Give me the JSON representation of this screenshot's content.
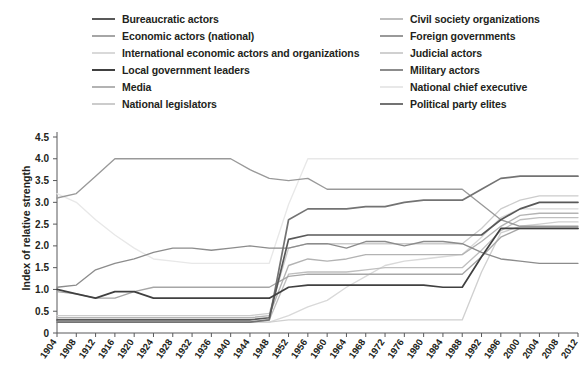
{
  "title_fragment": "",
  "legend": {
    "columns": [
      {
        "name": "left",
        "items": [
          {
            "label": "Bureaucratic actors",
            "color": "#595959"
          },
          {
            "label": "Economic actors (national)",
            "color": "#a6a6a6"
          },
          {
            "label": "International economic actors and organizations",
            "color": "#d9d9d9"
          },
          {
            "label": "Local government leaders",
            "color": "#404040"
          },
          {
            "label": "Media",
            "color": "#b3b3b3"
          },
          {
            "label": "National legislators",
            "color": "#cccccc"
          }
        ]
      },
      {
        "name": "right",
        "items": [
          {
            "label": "Civil society organizations",
            "color": "#bfbfbf"
          },
          {
            "label": "Foreign governments",
            "color": "#999999"
          },
          {
            "label": "Judicial actors",
            "color": "#d0d0d0"
          },
          {
            "label": "Military actors",
            "color": "#8c8c8c"
          },
          {
            "label": "National chief executive",
            "color": "#e8e8e8"
          },
          {
            "label": "Political party elites",
            "color": "#737373"
          }
        ]
      }
    ]
  },
  "chart_data": {
    "type": "line",
    "title": "",
    "xlabel": "",
    "ylabel": "Index of relative strength",
    "ylim": [
      0,
      4.5
    ],
    "yticks": [
      "0",
      "0.5",
      "1.0",
      "1.5",
      "2.0",
      "2.5",
      "3.0",
      "3.5",
      "4.0",
      "4.5"
    ],
    "grid": false,
    "legend_position": "top",
    "x": [
      1904,
      1908,
      1912,
      1916,
      1920,
      1924,
      1928,
      1932,
      1936,
      1940,
      1944,
      1948,
      1952,
      1956,
      1960,
      1964,
      1968,
      1972,
      1976,
      1980,
      1984,
      1988,
      1992,
      1996,
      2000,
      2004,
      2008,
      2012
    ],
    "series": [
      {
        "name": "Bureaucratic actors",
        "color": "#595959",
        "values": [
          0.3,
          0.3,
          0.3,
          0.3,
          0.3,
          0.3,
          0.3,
          0.3,
          0.3,
          0.3,
          0.3,
          0.35,
          2.15,
          2.25,
          2.25,
          2.25,
          2.25,
          2.25,
          2.25,
          2.25,
          2.25,
          2.25,
          2.25,
          2.6,
          2.85,
          3.0,
          3.0,
          3.0
        ]
      },
      {
        "name": "Economic actors (national)",
        "color": "#a6a6a6",
        "values": [
          0.95,
          0.9,
          0.8,
          0.8,
          0.95,
          1.05,
          1.05,
          1.05,
          1.05,
          1.05,
          1.05,
          1.05,
          1.3,
          1.35,
          1.35,
          1.35,
          1.35,
          1.35,
          1.35,
          1.35,
          1.35,
          1.35,
          1.75,
          2.2,
          2.4,
          2.4,
          2.4,
          2.4
        ]
      },
      {
        "name": "International economic actors and organizations",
        "color": "#d9d9d9",
        "values": [
          0.25,
          0.25,
          0.25,
          0.25,
          0.25,
          0.25,
          0.25,
          0.25,
          0.25,
          0.25,
          0.25,
          0.25,
          0.4,
          0.6,
          0.75,
          1.05,
          1.3,
          1.55,
          1.65,
          1.7,
          1.75,
          1.8,
          2.2,
          2.65,
          2.85,
          2.85,
          2.85,
          2.85
        ]
      },
      {
        "name": "Local government leaders",
        "color": "#404040",
        "values": [
          1.0,
          0.9,
          0.8,
          0.95,
          0.95,
          0.8,
          0.8,
          0.8,
          0.8,
          0.8,
          0.8,
          0.8,
          1.05,
          1.1,
          1.1,
          1.1,
          1.1,
          1.1,
          1.1,
          1.1,
          1.05,
          1.05,
          1.75,
          2.4,
          2.4,
          2.4,
          2.4,
          2.4
        ]
      },
      {
        "name": "Media",
        "color": "#b3b3b3",
        "values": [
          0.35,
          0.35,
          0.35,
          0.35,
          0.35,
          0.35,
          0.35,
          0.35,
          0.35,
          0.35,
          0.35,
          0.4,
          1.55,
          1.7,
          1.65,
          1.7,
          1.8,
          1.8,
          1.8,
          1.8,
          1.8,
          1.8,
          2.1,
          2.45,
          2.7,
          2.75,
          2.75,
          2.75
        ]
      },
      {
        "name": "National legislators",
        "color": "#cccccc",
        "values": [
          0.4,
          0.4,
          0.4,
          0.4,
          0.4,
          0.4,
          0.4,
          0.4,
          0.4,
          0.4,
          0.4,
          0.45,
          1.95,
          2.05,
          2.05,
          2.05,
          2.05,
          2.05,
          2.05,
          2.05,
          2.05,
          2.05,
          2.4,
          2.85,
          3.05,
          3.15,
          3.15,
          3.15
        ]
      },
      {
        "name": "Civil society organizations",
        "color": "#bfbfbf",
        "values": [
          0.25,
          0.25,
          0.25,
          0.25,
          0.25,
          0.25,
          0.25,
          0.25,
          0.25,
          0.25,
          0.25,
          0.3,
          1.35,
          1.4,
          1.4,
          1.4,
          1.45,
          1.5,
          1.5,
          1.5,
          1.5,
          1.5,
          1.9,
          2.35,
          2.6,
          2.65,
          2.65,
          2.65
        ]
      },
      {
        "name": "Foreign governments",
        "color": "#999999",
        "values": [
          3.1,
          3.2,
          3.6,
          4.0,
          4.0,
          4.0,
          4.0,
          4.0,
          4.0,
          4.0,
          3.75,
          3.55,
          3.5,
          3.55,
          3.3,
          3.3,
          3.3,
          3.3,
          3.3,
          3.3,
          3.3,
          3.3,
          2.95,
          2.6,
          2.45,
          2.45,
          2.45,
          2.45
        ]
      },
      {
        "name": "Judicial actors",
        "color": "#d0d0d0",
        "values": [
          0.25,
          0.25,
          0.25,
          0.25,
          0.25,
          0.25,
          0.25,
          0.25,
          0.25,
          0.25,
          0.25,
          0.25,
          0.3,
          0.3,
          0.3,
          0.3,
          0.3,
          0.3,
          0.3,
          0.3,
          0.3,
          0.3,
          1.4,
          2.3,
          2.45,
          2.5,
          2.55,
          2.55
        ]
      },
      {
        "name": "Military actors",
        "color": "#8c8c8c",
        "values": [
          1.05,
          1.1,
          1.45,
          1.6,
          1.7,
          1.85,
          1.95,
          1.95,
          1.9,
          1.95,
          2.0,
          1.95,
          1.95,
          2.05,
          2.05,
          1.95,
          2.1,
          2.1,
          2.0,
          2.1,
          2.1,
          2.05,
          1.85,
          1.7,
          1.65,
          1.6,
          1.6,
          1.6
        ]
      },
      {
        "name": "National chief executive",
        "color": "#e8e8e8",
        "values": [
          3.2,
          3.0,
          2.6,
          2.25,
          1.95,
          1.7,
          1.65,
          1.6,
          1.6,
          1.6,
          1.6,
          1.6,
          2.95,
          4.0,
          4.0,
          4.0,
          4.0,
          4.0,
          4.0,
          4.0,
          4.0,
          4.0,
          4.0,
          4.0,
          4.0,
          4.0,
          4.0,
          4.0
        ]
      },
      {
        "name": "Political party elites",
        "color": "#737373",
        "values": [
          0.25,
          0.25,
          0.25,
          0.25,
          0.25,
          0.25,
          0.25,
          0.25,
          0.25,
          0.25,
          0.25,
          0.3,
          2.6,
          2.85,
          2.85,
          2.85,
          2.9,
          2.9,
          3.0,
          3.05,
          3.05,
          3.05,
          3.3,
          3.55,
          3.6,
          3.6,
          3.6,
          3.6
        ]
      }
    ]
  }
}
